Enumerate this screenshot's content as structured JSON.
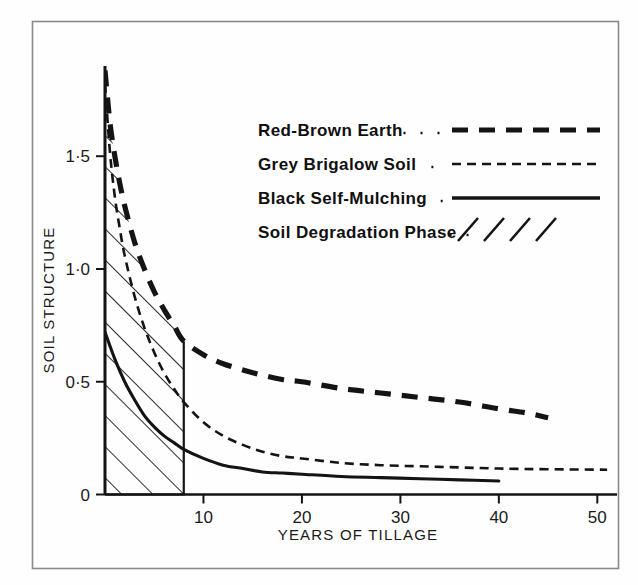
{
  "figure": {
    "frame_color": "#8a8a8a",
    "ink_color": "#141414",
    "background": "#fefefe"
  },
  "chart_data": {
    "type": "line",
    "title": "",
    "xlabel": "YEARS OF TILLAGE",
    "ylabel": "SOIL STRUCTURE",
    "xlim": [
      0,
      52
    ],
    "ylim": [
      0,
      1.9
    ],
    "grid": false,
    "xticks": [
      10,
      20,
      30,
      40,
      50
    ],
    "xtick_labels": [
      "10",
      "20",
      "30",
      "40",
      "50"
    ],
    "yticks": [
      0,
      0.5,
      1.0,
      1.5
    ],
    "ytick_labels": [
      "0",
      "0·5",
      "1·0",
      "1·5"
    ],
    "legend_position": "upper-right-inside",
    "annotations": [
      {
        "name": "soil-degradation-phase",
        "label": "Soil Degradation Phase",
        "type": "hatched-region",
        "x_range": [
          0,
          8
        ],
        "y_range": [
          0,
          "red-brown-earth curve"
        ],
        "hatch": "diagonal-45"
      }
    ],
    "series": [
      {
        "name": "Red-Brown Earth",
        "style": "thick-dashed",
        "x": [
          0,
          0.5,
          1,
          1.5,
          2,
          3,
          4,
          5,
          6,
          7,
          8,
          10,
          12,
          15,
          18,
          20,
          24,
          28,
          32,
          36,
          40,
          43,
          45
        ],
        "values": [
          1.88,
          1.65,
          1.5,
          1.38,
          1.28,
          1.12,
          1.0,
          0.9,
          0.82,
          0.75,
          0.68,
          0.62,
          0.58,
          0.54,
          0.51,
          0.5,
          0.47,
          0.45,
          0.43,
          0.41,
          0.38,
          0.36,
          0.34
        ]
      },
      {
        "name": "Grey Brigalow Soil",
        "style": "thin-dashed",
        "x": [
          0,
          0.5,
          1,
          1.5,
          2,
          3,
          4,
          5,
          6,
          7,
          8,
          10,
          12,
          14,
          16,
          18,
          20,
          24,
          28,
          32,
          36,
          40,
          45,
          51
        ],
        "values": [
          1.82,
          1.52,
          1.32,
          1.18,
          1.06,
          0.88,
          0.74,
          0.63,
          0.54,
          0.47,
          0.41,
          0.32,
          0.26,
          0.22,
          0.19,
          0.17,
          0.16,
          0.14,
          0.13,
          0.125,
          0.12,
          0.115,
          0.112,
          0.11
        ]
      },
      {
        "name": "Black Self-Mulching",
        "style": "solid",
        "x": [
          0,
          1,
          2,
          3,
          4,
          5,
          6,
          7,
          8,
          10,
          12,
          14,
          16,
          18,
          20,
          24,
          28,
          32,
          36,
          40
        ],
        "values": [
          0.72,
          0.6,
          0.5,
          0.42,
          0.35,
          0.3,
          0.26,
          0.23,
          0.2,
          0.16,
          0.13,
          0.115,
          0.1,
          0.095,
          0.09,
          0.08,
          0.075,
          0.07,
          0.065,
          0.06
        ]
      }
    ]
  },
  "legend": {
    "entries": [
      {
        "label": "Red-Brown Earth",
        "style": "thick-dashed",
        "leader": "dots"
      },
      {
        "label": "Grey Brigalow Soil",
        "style": "thin-dashed",
        "leader": "dots"
      },
      {
        "label": "Black Self-Mulching",
        "style": "solid",
        "leader": "dots"
      },
      {
        "label": "Soil Degradation Phase",
        "style": "hatch-slashes",
        "leader": "dots"
      }
    ]
  }
}
